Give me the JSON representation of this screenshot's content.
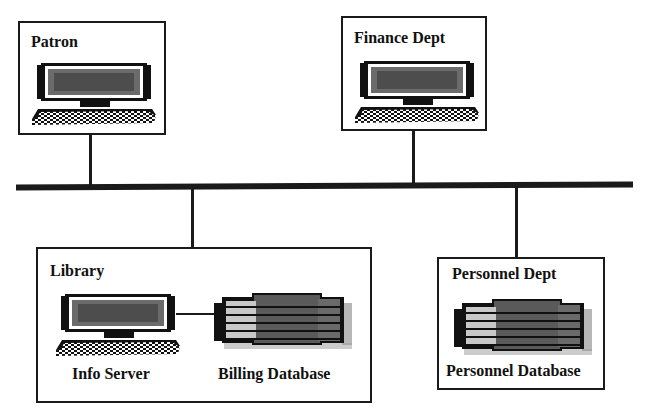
{
  "diagram": {
    "nodes": [
      {
        "id": "patron",
        "label": "Patron"
      },
      {
        "id": "finance",
        "label": "Finance Dept"
      },
      {
        "id": "library",
        "label": "Library",
        "components": [
          {
            "id": "info-server",
            "label": "Info Server",
            "icon": "computer-icon"
          },
          {
            "id": "billing-db",
            "label": "Billing Database",
            "icon": "database-icon"
          }
        ]
      },
      {
        "id": "personnel",
        "label": "Personnel Dept",
        "components": [
          {
            "id": "personnel-db",
            "label": "Personnel Database",
            "icon": "database-icon"
          }
        ]
      }
    ],
    "bus": {
      "label": "network-bus"
    },
    "edges": [
      [
        "patron",
        "bus"
      ],
      [
        "finance",
        "bus"
      ],
      [
        "library",
        "bus"
      ],
      [
        "personnel",
        "bus"
      ],
      [
        "info-server",
        "billing-db"
      ]
    ]
  },
  "colors": {
    "line": "#1a1a1a",
    "screen": "#6b6b6b",
    "db_dark": "#5a5a5a",
    "db_light": "#c8c8c8"
  }
}
